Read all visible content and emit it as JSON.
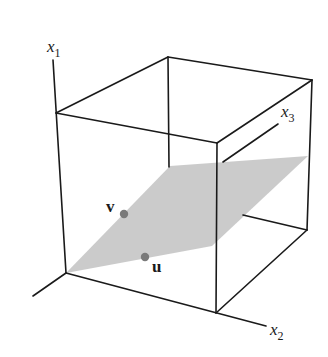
{
  "figure": {
    "colors": {
      "edge": "#1a1a1a",
      "plane": "#c8c8c8",
      "point": "#7a7a7a",
      "background": "#ffffff"
    },
    "axes": {
      "x1": {
        "label": "x",
        "sub": "1"
      },
      "x2": {
        "label": "x",
        "sub": "2"
      },
      "x3": {
        "label": "x",
        "sub": "3"
      }
    },
    "points": {
      "v": {
        "label": "v"
      },
      "u": {
        "label": "u"
      }
    }
  }
}
